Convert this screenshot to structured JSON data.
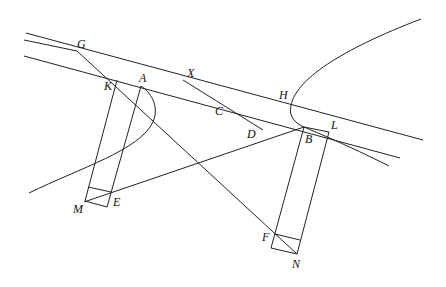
{
  "diagram": {
    "type": "geometric-construction",
    "labels": {
      "G": "G",
      "A": "A",
      "K": "K",
      "X": "X",
      "C": "C",
      "D": "D",
      "H": "H",
      "B": "B",
      "L": "L",
      "M": "M",
      "E": "E",
      "F": "F",
      "N": "N"
    },
    "colors": {
      "stroke": "#222222",
      "background": "#ffffff"
    }
  }
}
